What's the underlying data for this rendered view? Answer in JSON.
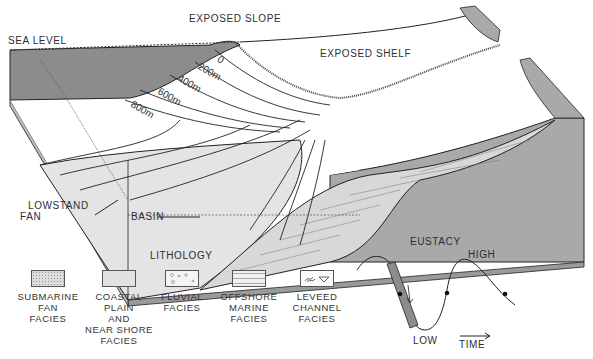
{
  "diagram": {
    "labels": {
      "sea_level": "SEA LEVEL",
      "exposed_slope": "EXPOSED SLOPE",
      "exposed_shelf": "EXPOSED SHELF",
      "lowstand_fan_line1": "LOWSTAND",
      "lowstand_fan_line2": "FAN",
      "basin": "BASIN"
    },
    "depth_contours": [
      "0",
      "200m",
      "400m",
      "600m",
      "800m"
    ],
    "colors": {
      "water": "#8c8c8c",
      "section_gray": "#a9a9a9",
      "fan_fill": "#e4e4e4",
      "line": "#1a1a1a"
    }
  },
  "lithology": {
    "title": "LITHOLOGY",
    "items": [
      {
        "line1": "SUBMARINE",
        "line2": "FAN",
        "line3": "FACIES",
        "line4": "",
        "line5": ""
      },
      {
        "line1": "COASTAL",
        "line2": "PLAIN",
        "line3": "AND",
        "line4": "NEAR SHORE",
        "line5": "FACIES"
      },
      {
        "line1": "FLUVIAL",
        "line2": "FACIES",
        "line3": "",
        "line4": "",
        "line5": ""
      },
      {
        "line1": "OFFSHORE",
        "line2": "MARINE",
        "line3": "FACIES",
        "line4": "",
        "line5": ""
      },
      {
        "line1": "LEVEED",
        "line2": "CHANNEL",
        "line3": "FACIES",
        "line4": "",
        "line5": ""
      }
    ]
  },
  "eustacy": {
    "title": "EUSTACY",
    "high_label": "HIGH",
    "low_label": "LOW",
    "time_label": "TIME"
  }
}
